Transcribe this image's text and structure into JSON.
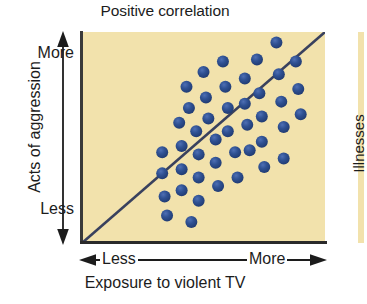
{
  "title": "Positive correlation",
  "y_axis": {
    "title": "Acts of aggression",
    "high_label": "More",
    "low_label": "Less"
  },
  "x_axis": {
    "title": "Exposure to violent TV",
    "low_label": "Less",
    "high_label": "More"
  },
  "neighbor_chart": {
    "y_axis_title": "Illnesses"
  },
  "colors": {
    "plot_background": "#f2e2ac",
    "dot": "#2a4a8a",
    "dot_highlight": "#4a6ab0",
    "axis": "#2a2a2a",
    "trend_line": "#39415e",
    "text": "#1c1c1c",
    "page_background": "#ffffff"
  },
  "chart_data": {
    "type": "scatter",
    "title": "Positive correlation",
    "xlabel": "Exposure to violent TV",
    "ylabel": "Acts of aggression",
    "xlim": [
      0,
      100
    ],
    "ylim": [
      0,
      100
    ],
    "xtick_labels": [
      "Less",
      "More"
    ],
    "ytick_labels": [
      "Less",
      "More"
    ],
    "grid": false,
    "legend": "none",
    "annotation": "Scatterplot of 44 data points rising from lower-left to upper-right, with a straight best-fit trend line drawn from the bottom-left corner to the top-right corner, illustrating a positive correlation.",
    "dot_radius_px": 6,
    "points": [
      [
        33,
        43
      ],
      [
        33,
        33
      ],
      [
        34,
        22
      ],
      [
        35,
        13
      ],
      [
        40,
        57
      ],
      [
        41,
        46
      ],
      [
        41,
        35
      ],
      [
        41,
        25
      ],
      [
        43,
        74
      ],
      [
        44,
        64
      ],
      [
        45,
        10
      ],
      [
        47,
        53
      ],
      [
        48,
        42
      ],
      [
        48,
        31
      ],
      [
        48,
        20
      ],
      [
        50,
        81
      ],
      [
        51,
        69
      ],
      [
        52,
        59
      ],
      [
        55,
        49
      ],
      [
        55,
        38
      ],
      [
        56,
        27
      ],
      [
        58,
        86
      ],
      [
        59,
        74
      ],
      [
        60,
        64
      ],
      [
        60,
        53
      ],
      [
        63,
        43
      ],
      [
        64,
        31
      ],
      [
        67,
        78
      ],
      [
        67,
        66
      ],
      [
        68,
        56
      ],
      [
        69,
        44
      ],
      [
        72,
        87
      ],
      [
        73,
        71
      ],
      [
        74,
        60
      ],
      [
        74,
        48
      ],
      [
        75,
        36
      ],
      [
        80,
        95
      ],
      [
        81,
        80
      ],
      [
        82,
        67
      ],
      [
        83,
        55
      ],
      [
        83,
        40
      ],
      [
        88,
        86
      ],
      [
        89,
        73
      ],
      [
        90,
        61
      ]
    ],
    "trend_line": {
      "type": "linear-fit",
      "x": [
        0,
        100
      ],
      "y": [
        0,
        100
      ]
    }
  }
}
